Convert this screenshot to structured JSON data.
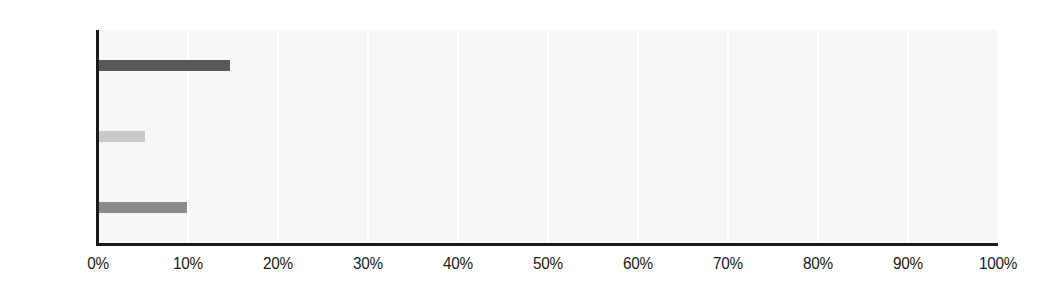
{
  "chart_data": {
    "type": "bar",
    "orientation": "horizontal",
    "title": "",
    "xlabel": "",
    "ylabel": "",
    "categories": [
      "Men",
      "Women",
      "All"
    ],
    "values": [
      14.7,
      5.2,
      9.9
    ],
    "value_labels": [
      "14.7%",
      "5.2%",
      "9.9%"
    ],
    "bar_colors": [
      "#585858",
      "#c9c9c9",
      "#8c8c8c"
    ],
    "xlim": [
      0,
      100
    ],
    "xticks": [
      0,
      10,
      20,
      30,
      40,
      50,
      60,
      70,
      80,
      90,
      100
    ],
    "xtick_labels": [
      "0%",
      "10%",
      "20%",
      "30%",
      "40%",
      "50%",
      "60%",
      "70%",
      "80%",
      "90%",
      "100%"
    ],
    "grid": "vertical",
    "gridline_color": "#ffffff",
    "plot_background": "#f7f7f7",
    "axis_color": "#1a1a1a",
    "legend": "none",
    "series": [
      {
        "name": "Percent",
        "points": [
          {
            "category": "Men",
            "value": 14.7,
            "color": "#585858"
          },
          {
            "category": "Women",
            "value": 5.2,
            "color": "#c9c9c9"
          },
          {
            "category": "All",
            "value": 9.9,
            "color": "#8c8c8c"
          }
        ]
      }
    ]
  }
}
